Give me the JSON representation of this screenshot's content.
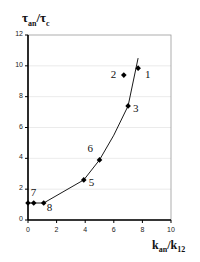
{
  "chart_data": {
    "type": "scatter",
    "title": "",
    "ylabel": "τan/τc",
    "ylabel_main": "τ",
    "ylabel_sub1": "an",
    "ylabel_sep": "/τ",
    "ylabel_sub2": "c",
    "xlabel": "kan/k12",
    "xlabel_main": "k",
    "xlabel_sub1": "an",
    "xlabel_sep": "/k",
    "xlabel_sub2": "12",
    "xlim": [
      0,
      10
    ],
    "ylim": [
      0,
      12
    ],
    "xticks": [
      "0",
      "2",
      "4",
      "6",
      "8",
      "10"
    ],
    "yticks": [
      "0",
      "2",
      "4",
      "6",
      "8",
      "10",
      "12"
    ],
    "grid": "horizontal light gridlines",
    "legend": "none",
    "points": [
      {
        "label": "",
        "x": 0.0,
        "y": 1.1
      },
      {
        "label": "7",
        "x": 0.4,
        "y": 1.1
      },
      {
        "label": "8",
        "x": 1.1,
        "y": 1.1
      },
      {
        "label": "5",
        "x": 3.9,
        "y": 2.6
      },
      {
        "label": "6",
        "x": 5.0,
        "y": 3.9
      },
      {
        "label": "3",
        "x": 7.0,
        "y": 7.4
      },
      {
        "label": "2",
        "x": 6.7,
        "y": 9.4
      },
      {
        "label": "1",
        "x": 7.7,
        "y": 9.85
      }
    ],
    "trend_line": {
      "x": [
        0.0,
        1.1,
        3.9,
        5.0,
        6.0,
        7.0,
        7.7
      ],
      "y": [
        1.1,
        1.1,
        2.6,
        3.9,
        5.5,
        7.4,
        10.5
      ]
    }
  }
}
